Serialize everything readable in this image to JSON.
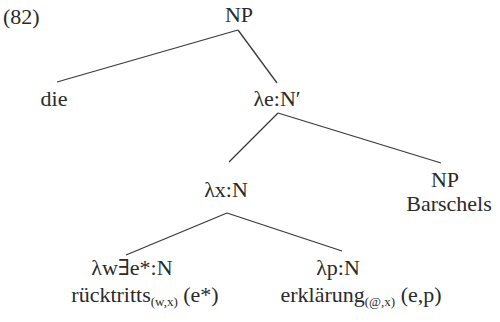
{
  "example_number": "(82)",
  "tree": {
    "root": {
      "label": "NP"
    },
    "det": {
      "label": "die"
    },
    "nbar": {
      "label": "λe:N′"
    },
    "n": {
      "label": "λx:N"
    },
    "possessor": {
      "category": "NP",
      "word": "Barschels"
    },
    "left_leaf": {
      "label": "λw∃e*:N",
      "word": "rücktritts",
      "subscript": "(w,x)",
      "args": "(e*)"
    },
    "right_leaf": {
      "label": "λp:N",
      "word": "erklärung",
      "subscript": "(@,x)",
      "args": "(e,p)"
    }
  },
  "edges": [
    {
      "from": "NP",
      "to": "die"
    },
    {
      "from": "NP",
      "to": "λe:N′"
    },
    {
      "from": "λe:N′",
      "to": "λx:N"
    },
    {
      "from": "λe:N′",
      "to": "NP Barschels"
    },
    {
      "from": "λx:N",
      "to": "λw∃e*:N"
    },
    {
      "from": "λx:N",
      "to": "λp:N"
    }
  ]
}
